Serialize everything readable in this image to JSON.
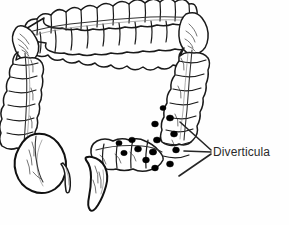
{
  "figure": {
    "background_color": "#fefefe",
    "ink_color": "#1a1a1a",
    "dot_color": "#000000",
    "shade_color": "#8a8a8a",
    "width": 289,
    "height": 225
  },
  "labels": [
    {
      "id": "diverticula",
      "text": "Diverticula",
      "x": 213,
      "y": 145,
      "font_size": 12,
      "color": "#2b2b2b"
    }
  ],
  "leader_lines": [
    {
      "id": "leader-upper",
      "x1": 211,
      "y1": 150,
      "x2": 180,
      "y2": 122
    },
    {
      "id": "leader-middle",
      "x1": 211,
      "y1": 152,
      "x2": 184,
      "y2": 151
    },
    {
      "id": "leader-lower",
      "x1": 211,
      "y1": 154,
      "x2": 179,
      "y2": 176
    }
  ],
  "anatomy_parts": [
    {
      "id": "ascending-colon",
      "name": "Ascending colon"
    },
    {
      "id": "hepatic-flexure",
      "name": "Hepatic flexure"
    },
    {
      "id": "transverse-colon",
      "name": "Transverse colon"
    },
    {
      "id": "splenic-flexure",
      "name": "Splenic flexure"
    },
    {
      "id": "descending-colon",
      "name": "Descending colon"
    },
    {
      "id": "sigmoid-colon",
      "name": "Sigmoid colon"
    },
    {
      "id": "rectum",
      "name": "Rectum"
    },
    {
      "id": "cecum",
      "name": "Cecum"
    },
    {
      "id": "appendix",
      "name": "Appendix"
    }
  ],
  "diverticula_dots": [
    {
      "cx": 170,
      "cy": 118,
      "rx": 3.6,
      "ry": 3.0
    },
    {
      "cx": 155,
      "cy": 124,
      "rx": 3.4,
      "ry": 2.9
    },
    {
      "cx": 174,
      "cy": 134,
      "rx": 3.5,
      "ry": 3.0
    },
    {
      "cx": 157,
      "cy": 140,
      "rx": 3.6,
      "ry": 3.0
    },
    {
      "cx": 176,
      "cy": 150,
      "rx": 3.4,
      "ry": 2.9
    },
    {
      "cx": 153,
      "cy": 152,
      "rx": 3.7,
      "ry": 3.1
    },
    {
      "cx": 170,
      "cy": 164,
      "rx": 3.5,
      "ry": 3.0
    },
    {
      "cx": 155,
      "cy": 168,
      "rx": 3.4,
      "ry": 2.9
    },
    {
      "cx": 138,
      "cy": 149,
      "rx": 3.5,
      "ry": 3.0
    },
    {
      "cx": 132,
      "cy": 140,
      "rx": 3.3,
      "ry": 2.8
    },
    {
      "cx": 146,
      "cy": 160,
      "rx": 3.4,
      "ry": 2.9
    },
    {
      "cx": 124,
      "cy": 153,
      "rx": 3.2,
      "ry": 2.7
    },
    {
      "cx": 119,
      "cy": 143,
      "rx": 3.1,
      "ry": 2.6
    },
    {
      "cx": 163,
      "cy": 108,
      "rx": 3.0,
      "ry": 2.5
    }
  ],
  "haustra": {
    "ascending_count": 8,
    "transverse_upper_count": 11,
    "transverse_lower_count": 11,
    "descending_count": 10,
    "sigmoid_count": 7
  }
}
